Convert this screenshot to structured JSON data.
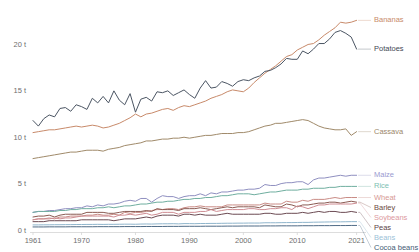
{
  "chart_data": {
    "type": "line",
    "title": "",
    "subtitle": "",
    "xlabel": "",
    "ylabel": "",
    "xlim": [
      1961,
      2022
    ],
    "ylim": [
      0,
      23.5
    ],
    "grid": false,
    "legend_position": "right-inline",
    "x_tick_labels": [
      "1961",
      "1970",
      "1980",
      "1990",
      "2000",
      "2010",
      "2021"
    ],
    "x_ticks": [
      1961,
      1970,
      1980,
      1990,
      2000,
      2010,
      2021
    ],
    "y_tick_labels": [
      "0 t",
      "5 t",
      "10 t",
      "15 t",
      "20 t"
    ],
    "y_ticks": [
      0,
      5,
      10,
      15,
      20
    ],
    "x": [
      1961,
      1962,
      1963,
      1964,
      1965,
      1966,
      1967,
      1968,
      1969,
      1970,
      1971,
      1972,
      1973,
      1974,
      1975,
      1976,
      1977,
      1978,
      1979,
      1980,
      1981,
      1982,
      1983,
      1984,
      1985,
      1986,
      1987,
      1988,
      1989,
      1990,
      1991,
      1992,
      1993,
      1994,
      1995,
      1996,
      1997,
      1998,
      1999,
      2000,
      2001,
      2002,
      2003,
      2004,
      2005,
      2006,
      2007,
      2008,
      2009,
      2010,
      2011,
      2012,
      2013,
      2014,
      2015,
      2016,
      2017,
      2018,
      2019,
      2020,
      2021
    ],
    "series": [
      {
        "name": "Bananas",
        "color": "#c88a6a",
        "label_color": "#c88a6a",
        "values": [
          10.5,
          10.6,
          10.7,
          10.8,
          10.8,
          10.9,
          11.0,
          11.1,
          11.2,
          11.1,
          11.2,
          11.3,
          11.2,
          11.0,
          11.1,
          11.3,
          11.5,
          11.8,
          12.1,
          12.5,
          12.2,
          12.5,
          12.6,
          12.8,
          13.0,
          13.1,
          12.9,
          13.2,
          13.4,
          13.3,
          13.5,
          13.7,
          13.9,
          14.2,
          14.4,
          14.6,
          14.9,
          15.1,
          15.0,
          14.9,
          15.3,
          15.9,
          16.4,
          16.9,
          17.3,
          17.7,
          18.2,
          18.7,
          18.9,
          19.4,
          19.7,
          20.0,
          20.1,
          20.5,
          21.0,
          21.4,
          21.8,
          22.4,
          22.3,
          22.4,
          22.6
        ]
      },
      {
        "name": "Potatoes",
        "color": "#4b5563",
        "label_color": "#3f4753",
        "values": [
          11.8,
          11.2,
          12.0,
          12.4,
          12.2,
          13.1,
          13.2,
          12.8,
          13.5,
          13.3,
          13.0,
          14.2,
          13.7,
          14.4,
          13.7,
          15.0,
          14.0,
          13.5,
          14.7,
          12.7,
          14.1,
          14.3,
          13.9,
          14.9,
          14.8,
          15.0,
          14.5,
          14.8,
          15.1,
          14.6,
          14.2,
          15.3,
          16.1,
          15.3,
          15.4,
          16.0,
          15.8,
          15.5,
          16.0,
          16.2,
          16.1,
          16.4,
          16.6,
          17.1,
          17.2,
          17.5,
          17.9,
          18.5,
          18.4,
          18.4,
          19.3,
          19.0,
          19.5,
          20.1,
          20.1,
          20.6,
          21.3,
          21.5,
          21.2,
          20.8,
          19.5
        ]
      },
      {
        "name": "Cassava",
        "color": "#a08a6a",
        "label_color": "#9b876a",
        "values": [
          7.7,
          7.8,
          7.9,
          8.0,
          8.1,
          8.2,
          8.3,
          8.4,
          8.4,
          8.5,
          8.6,
          8.6,
          8.6,
          8.5,
          8.7,
          8.8,
          8.9,
          9.1,
          9.2,
          9.3,
          9.4,
          9.6,
          9.6,
          9.7,
          9.8,
          9.8,
          9.9,
          9.9,
          10.0,
          9.9,
          10.0,
          10.1,
          10.2,
          10.2,
          10.3,
          10.4,
          10.4,
          10.4,
          10.5,
          10.5,
          10.6,
          10.8,
          11.0,
          11.2,
          11.3,
          11.5,
          11.5,
          11.6,
          11.7,
          11.8,
          11.9,
          11.8,
          11.5,
          11.2,
          11.0,
          10.9,
          10.8,
          10.8,
          10.9,
          10.2,
          10.6
        ]
      },
      {
        "name": "Maize",
        "color": "#8f8fc0",
        "label_color": "#9a9ad0",
        "values": [
          1.9,
          2.0,
          2.0,
          2.1,
          2.1,
          2.2,
          2.3,
          2.3,
          2.4,
          2.4,
          2.6,
          2.5,
          2.7,
          2.6,
          2.8,
          2.8,
          2.9,
          3.1,
          3.2,
          3.1,
          3.4,
          3.4,
          3.0,
          3.4,
          3.7,
          3.6,
          3.6,
          3.4,
          3.6,
          3.7,
          3.7,
          3.9,
          3.7,
          4.0,
          3.9,
          4.1,
          4.1,
          4.2,
          4.3,
          4.3,
          4.4,
          4.4,
          4.5,
          4.9,
          4.8,
          4.8,
          5.0,
          5.1,
          5.1,
          5.2,
          5.2,
          4.9,
          5.4,
          5.6,
          5.6,
          5.7,
          5.8,
          5.9,
          5.8,
          5.9,
          5.9
        ]
      },
      {
        "name": "Rice",
        "color": "#6fae9f",
        "label_color": "#7cc0b2",
        "values": [
          1.9,
          2.0,
          2.0,
          2.0,
          2.0,
          2.1,
          2.1,
          2.2,
          2.2,
          2.3,
          2.3,
          2.3,
          2.4,
          2.4,
          2.5,
          2.4,
          2.5,
          2.6,
          2.6,
          2.7,
          2.8,
          2.8,
          2.9,
          3.0,
          3.0,
          3.1,
          3.1,
          3.2,
          3.3,
          3.3,
          3.4,
          3.4,
          3.5,
          3.5,
          3.6,
          3.7,
          3.7,
          3.8,
          3.9,
          3.9,
          3.9,
          3.8,
          3.9,
          4.0,
          4.1,
          4.1,
          4.2,
          4.3,
          4.3,
          4.3,
          4.4,
          4.4,
          4.5,
          4.5,
          4.5,
          4.6,
          4.6,
          4.7,
          4.7,
          4.7,
          4.7
        ]
      },
      {
        "name": "Wheat",
        "color": "#c98b85",
        "label_color": "#d79a94",
        "values": [
          1.1,
          1.2,
          1.2,
          1.3,
          1.2,
          1.4,
          1.4,
          1.5,
          1.5,
          1.5,
          1.6,
          1.6,
          1.7,
          1.6,
          1.6,
          1.7,
          1.6,
          1.9,
          1.8,
          1.9,
          1.9,
          2.0,
          2.1,
          2.2,
          2.2,
          2.3,
          2.3,
          2.2,
          2.4,
          2.5,
          2.5,
          2.6,
          2.5,
          2.5,
          2.5,
          2.5,
          2.7,
          2.7,
          2.7,
          2.7,
          2.7,
          2.7,
          2.7,
          2.9,
          2.8,
          2.8,
          2.8,
          3.1,
          3.0,
          3.0,
          3.2,
          3.1,
          3.3,
          3.3,
          3.3,
          3.4,
          3.5,
          3.4,
          3.5,
          3.5,
          3.5
        ]
      },
      {
        "name": "Barley",
        "color": "#8a5a52",
        "label_color": "#6b4a44",
        "values": [
          1.4,
          1.5,
          1.5,
          1.6,
          1.4,
          1.6,
          1.7,
          1.7,
          1.7,
          1.7,
          1.9,
          1.9,
          1.9,
          1.9,
          1.8,
          1.8,
          1.9,
          2.0,
          2.0,
          2.0,
          2.0,
          2.1,
          2.0,
          2.3,
          2.2,
          2.2,
          2.2,
          2.1,
          2.3,
          2.3,
          2.3,
          2.4,
          2.3,
          2.2,
          2.3,
          2.4,
          2.5,
          2.4,
          2.5,
          2.5,
          2.5,
          2.5,
          2.4,
          2.7,
          2.6,
          2.5,
          2.5,
          2.8,
          2.7,
          2.5,
          2.7,
          2.7,
          2.8,
          2.9,
          2.9,
          3.0,
          3.0,
          2.9,
          3.0,
          3.1,
          3.0
        ]
      },
      {
        "name": "Soybeans",
        "color": "#cf8d93",
        "label_color": "#dc9aa0",
        "values": [
          1.1,
          1.2,
          1.2,
          1.2,
          1.3,
          1.2,
          1.3,
          1.3,
          1.4,
          1.5,
          1.5,
          1.5,
          1.5,
          1.5,
          1.5,
          1.4,
          1.6,
          1.6,
          1.7,
          1.6,
          1.7,
          1.8,
          1.6,
          1.7,
          1.9,
          1.9,
          1.9,
          1.7,
          1.9,
          1.9,
          1.9,
          2.0,
          2.0,
          2.2,
          2.0,
          2.1,
          2.2,
          2.2,
          2.2,
          2.2,
          2.3,
          2.3,
          2.2,
          2.2,
          2.3,
          2.3,
          2.4,
          2.4,
          2.2,
          2.6,
          2.5,
          2.3,
          2.5,
          2.7,
          2.7,
          2.8,
          2.8,
          2.8,
          2.8,
          2.8,
          2.9
        ]
      },
      {
        "name": "Peas",
        "color": "#6b4a52",
        "label_color": "#5a3f46",
        "values": [
          0.9,
          0.9,
          0.9,
          1.0,
          1.0,
          1.0,
          1.0,
          1.0,
          1.0,
          1.1,
          1.1,
          1.1,
          1.1,
          1.1,
          1.1,
          1.0,
          1.1,
          1.2,
          1.2,
          1.2,
          1.3,
          1.4,
          1.3,
          1.5,
          1.6,
          1.6,
          1.6,
          1.5,
          1.7,
          1.7,
          1.6,
          1.7,
          1.6,
          1.6,
          1.6,
          1.7,
          1.8,
          1.7,
          1.7,
          1.7,
          1.7,
          1.7,
          1.7,
          1.8,
          1.8,
          1.7,
          1.7,
          1.8,
          1.8,
          1.8,
          1.9,
          1.8,
          1.9,
          2.0,
          1.9,
          2.0,
          2.0,
          1.9,
          1.9,
          2.0,
          1.9
        ]
      },
      {
        "name": "Beans",
        "color": "#8fb5cc",
        "label_color": "#9cc2d8",
        "values": [
          0.55,
          0.55,
          0.56,
          0.56,
          0.57,
          0.57,
          0.58,
          0.58,
          0.59,
          0.59,
          0.6,
          0.6,
          0.61,
          0.6,
          0.61,
          0.61,
          0.62,
          0.63,
          0.63,
          0.62,
          0.64,
          0.65,
          0.64,
          0.66,
          0.67,
          0.67,
          0.68,
          0.66,
          0.69,
          0.69,
          0.68,
          0.7,
          0.7,
          0.71,
          0.71,
          0.72,
          0.73,
          0.73,
          0.74,
          0.74,
          0.75,
          0.75,
          0.75,
          0.78,
          0.78,
          0.78,
          0.79,
          0.8,
          0.8,
          0.81,
          0.82,
          0.82,
          0.84,
          0.85,
          0.86,
          0.87,
          0.88,
          0.88,
          0.89,
          0.9,
          0.9
        ]
      },
      {
        "name": "Cocoa beans",
        "color": "#4f6b86",
        "label_color": "#3f5a74",
        "values": [
          0.33,
          0.33,
          0.33,
          0.34,
          0.34,
          0.34,
          0.34,
          0.35,
          0.35,
          0.35,
          0.35,
          0.35,
          0.36,
          0.36,
          0.36,
          0.36,
          0.36,
          0.37,
          0.37,
          0.37,
          0.37,
          0.38,
          0.38,
          0.38,
          0.38,
          0.39,
          0.39,
          0.39,
          0.4,
          0.4,
          0.4,
          0.4,
          0.41,
          0.41,
          0.41,
          0.41,
          0.42,
          0.42,
          0.42,
          0.43,
          0.43,
          0.43,
          0.43,
          0.44,
          0.44,
          0.44,
          0.45,
          0.45,
          0.45,
          0.45,
          0.46,
          0.46,
          0.46,
          0.47,
          0.47,
          0.47,
          0.48,
          0.48,
          0.48,
          0.49,
          0.49
        ]
      }
    ]
  },
  "legend_labels": {
    "bananas": "Bananas",
    "potatoes": "Potatoes",
    "cassava": "Cassava",
    "maize": "Maize",
    "rice": "Rice",
    "wheat": "Wheat",
    "barley": "Barley",
    "soybeans": "Soybeans",
    "peas": "Peas",
    "beans": "Beans",
    "cocoa_beans": "Cocoa beans"
  }
}
